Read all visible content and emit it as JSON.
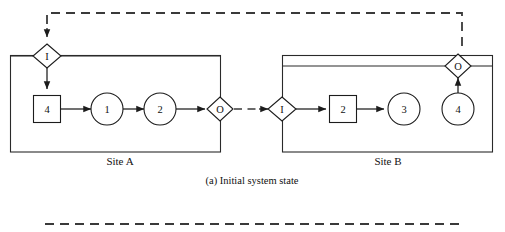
{
  "figure": {
    "caption": "(a) Initial system state",
    "line_color": "#1c1c1c",
    "dashed_color": "#3a3a3a",
    "background": "#ffffff"
  },
  "sites": [
    {
      "id": "site-a",
      "label": "Site A",
      "input_port": {
        "label": "I",
        "shape": "diamond"
      },
      "output_port": {
        "label": "O",
        "shape": "diamond"
      },
      "nodes": [
        {
          "label": "4",
          "shape": "square"
        },
        {
          "label": "1",
          "shape": "circle"
        },
        {
          "label": "2",
          "shape": "circle"
        }
      ]
    },
    {
      "id": "site-b",
      "label": "Site B",
      "input_port": {
        "label": "I",
        "shape": "diamond"
      },
      "output_port": {
        "label": "O",
        "shape": "diamond"
      },
      "nodes": [
        {
          "label": "2",
          "shape": "square"
        },
        {
          "label": "3",
          "shape": "circle"
        },
        {
          "label": "4",
          "shape": "circle"
        }
      ]
    }
  ],
  "labels": {
    "site_a_io_in": "I",
    "site_a_io_out": "O",
    "site_a_n1": "4",
    "site_a_n2": "1",
    "site_a_n3": "2",
    "site_b_io_in": "I",
    "site_b_io_out": "O",
    "site_b_n1": "2",
    "site_b_n2": "3",
    "site_b_n3": "4",
    "site_a_name": "Site A",
    "site_b_name": "Site B",
    "caption": "(a) Initial system state"
  }
}
